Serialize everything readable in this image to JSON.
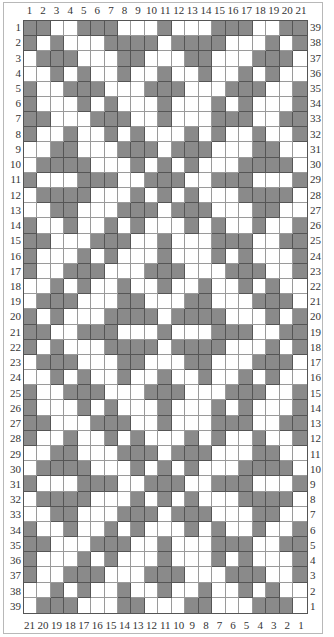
{
  "chart": {
    "columns": 21,
    "rows": 39,
    "colors": {
      "filled": "#8a8a8a",
      "empty": "#ffffff",
      "grid_line": "#9a9a9a",
      "filled_line": "#555555",
      "frame": "#b8b8b8"
    },
    "top_labels": [
      "1",
      "2",
      "3",
      "4",
      "5",
      "6",
      "7",
      "8",
      "9",
      "10",
      "11",
      "12",
      "13",
      "14",
      "15",
      "16",
      "17",
      "18",
      "19",
      "20",
      "21"
    ],
    "bottom_labels": [
      "21",
      "20",
      "19",
      "18",
      "17",
      "16",
      "15",
      "14",
      "13",
      "12",
      "11",
      "10",
      "9",
      "8",
      "7",
      "6",
      "5",
      "4",
      "3",
      "2",
      "1"
    ],
    "left_labels": [
      "1",
      "2",
      "3",
      "4",
      "5",
      "6",
      "7",
      "8",
      "9",
      "10",
      "11",
      "12",
      "13",
      "14",
      "15",
      "16",
      "17",
      "18",
      "19",
      "20",
      "21",
      "22",
      "23",
      "24",
      "25",
      "26",
      "27",
      "28",
      "29",
      "30",
      "31",
      "32",
      "33",
      "34",
      "35",
      "36",
      "37",
      "38",
      "39"
    ],
    "right_labels": [
      "39",
      "38",
      "37",
      "36",
      "35",
      "34",
      "33",
      "32",
      "31",
      "30",
      "29",
      "28",
      "27",
      "26",
      "25",
      "24",
      "23",
      "22",
      "21",
      "20",
      "19",
      "18",
      "17",
      "16",
      "15",
      "14",
      "13",
      "12",
      "11",
      "10",
      "9",
      "8",
      "7",
      "6",
      "5",
      "4",
      "3",
      "2",
      "1"
    ],
    "pattern_rows": [
      "110011100010001110011",
      "101000111101111000101",
      "011100011000110001110",
      "001010010010010010100",
      "100111000111000111001",
      "100010100010001010001",
      "110001110010001110011",
      "100100101000101001001",
      "001100011101110001100",
      "011110001010100011110",
      "100011100111001110001",
      "011110001010100011110",
      "001100011101110001100",
      "100100101000101001001",
      "110001110010001110011",
      "100010100010001010001",
      "100111000111000111001",
      "001010010010010010100",
      "011100011000110001110",
      "101000111101111000101",
      "110011100010001110011",
      "101000111101111000101",
      "011100011000110001110",
      "001010010010010010100",
      "100111000111000111001",
      "100010100010001010001",
      "110001110010001110011",
      "100100101000101001001",
      "001100011101110001100",
      "011110001010100011110",
      "100011100111001110001",
      "011110001010100011110",
      "001100011101110001100",
      "100100101000101001001",
      "110001110010001110011",
      "100010100010001010001",
      "100111000111000111001",
      "001010010010010010100",
      "011100011000110001110"
    ]
  }
}
